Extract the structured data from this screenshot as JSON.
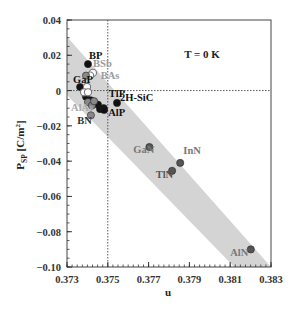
{
  "chart_data": {
    "type": "scatter",
    "title": "",
    "annotation": "T = 0 K",
    "xlabel": "u",
    "ylabel": "P_SP [C/m²]",
    "ylabel_main": "P",
    "ylabel_sub": "SP",
    "ylabel_unit": "[C/m",
    "ylabel_sup": "2",
    "ylabel_close": "]",
    "xlim": [
      0.373,
      0.383
    ],
    "ylim": [
      -0.1,
      0.04
    ],
    "xticks": [
      0.373,
      0.375,
      0.377,
      0.379,
      0.381,
      0.383
    ],
    "xtick_labels": [
      "0.373",
      "0.375",
      "0.377",
      "0.379",
      "0.381",
      "0.383"
    ],
    "yticks": [
      0.04,
      0.02,
      0,
      -0.02,
      -0.04,
      -0.06,
      -0.08,
      -0.1
    ],
    "ytick_labels": [
      "0.04",
      "0.02",
      "0",
      "−0.02",
      "−0.04",
      "−0.06",
      "−0.08",
      "−0.10"
    ],
    "reference_lines": {
      "u_ideal": 0.375,
      "p_zero": 0
    },
    "grid": false,
    "band": {
      "description": "shaded linear trend band",
      "polygon_data": [
        [
          0.373,
          0.0305
        ],
        [
          0.373,
          -0.0025
        ],
        [
          0.3812,
          -0.1
        ],
        [
          0.383,
          -0.1
        ]
      ]
    },
    "series": [
      {
        "name": "black-filled",
        "marker": "filled-circle",
        "color": "#111111",
        "points": [
          {
            "label": "BP",
            "u": 0.37403,
            "p": 0.015
          },
          {
            "label": "GaP",
            "u": 0.37364,
            "p": 0.002
          },
          {
            "label": "",
            "u": 0.37393,
            "p": -0.0035
          },
          {
            "label": "",
            "u": 0.37452,
            "p": -0.008
          },
          {
            "label": "",
            "u": 0.37462,
            "p": -0.0105
          },
          {
            "label": "",
            "u": 0.3748,
            "p": -0.01
          },
          {
            "label": "AlP",
            "u": 0.37482,
            "p": -0.011
          },
          {
            "label": "",
            "u": 0.37417,
            "p": -0.0055
          },
          {
            "label": "TlP 2H-SiC",
            "u": 0.37545,
            "p": -0.007
          }
        ]
      },
      {
        "name": "open-circles",
        "marker": "open-circle",
        "color": "#777777",
        "points": [
          {
            "label": "BSb",
            "u": 0.37427,
            "p": 0.01
          },
          {
            "label": "",
            "u": 0.37413,
            "p": 0.0085
          },
          {
            "label": "BAs",
            "u": 0.37398,
            "p": 0.002
          },
          {
            "label": "",
            "u": 0.37384,
            "p": -0.001
          },
          {
            "label": "",
            "u": 0.37403,
            "p": -0.001
          }
        ]
      },
      {
        "name": "gray-filled",
        "marker": "filled-circle",
        "color": "#888888",
        "points": [
          {
            "label": "",
            "u": 0.37393,
            "p": 0.0085
          },
          {
            "label": "AlAs",
            "u": 0.37403,
            "p": -0.0065
          },
          {
            "label": "",
            "u": 0.37422,
            "p": -0.0085
          },
          {
            "label": "",
            "u": 0.37433,
            "p": -0.006
          },
          {
            "label": "BN",
            "u": 0.37417,
            "p": -0.014
          }
        ]
      },
      {
        "name": "dark-gray-filled",
        "marker": "filled-circle",
        "color": "#555555",
        "points": [
          {
            "label": "GaN",
            "u": 0.37704,
            "p": -0.032
          },
          {
            "label": "InN",
            "u": 0.37855,
            "p": -0.041
          },
          {
            "label": "TlN",
            "u": 0.37815,
            "p": -0.0455
          },
          {
            "label": "AlN",
            "u": 0.38201,
            "p": -0.09
          }
        ]
      }
    ],
    "point_labels": [
      {
        "text": "BP",
        "u": 0.37408,
        "p": 0.018,
        "color": "#111111"
      },
      {
        "text": "BSb",
        "u": 0.37428,
        "p": 0.0135,
        "color": "#9a9a9a"
      },
      {
        "text": "BAs",
        "u": 0.37465,
        "p": 0.0065,
        "color": "#9a9a9a"
      },
      {
        "text": "GaP",
        "u": 0.3733,
        "p": 0.0045,
        "color": "#111111"
      },
      {
        "text": "TlP",
        "u": 0.37505,
        "p": -0.0035,
        "color": "#111111"
      },
      {
        "text": "2H-SiC",
        "u": 0.3756,
        "p": -0.006,
        "color": "#111111"
      },
      {
        "text": "AlAs",
        "u": 0.3732,
        "p": -0.0115,
        "color": "#aaaaaa"
      },
      {
        "text": "AlP",
        "u": 0.37502,
        "p": -0.0145,
        "color": "#111111"
      },
      {
        "text": "BN",
        "u": 0.3735,
        "p": -0.019,
        "color": "#333333"
      },
      {
        "text": "GaN",
        "u": 0.37625,
        "p": -0.0355,
        "color": "#777777"
      },
      {
        "text": "InN",
        "u": 0.3787,
        "p": -0.036,
        "color": "#777777"
      },
      {
        "text": "TlN",
        "u": 0.37735,
        "p": -0.0495,
        "color": "#555555"
      },
      {
        "text": "AlN",
        "u": 0.381,
        "p": -0.0935,
        "color": "#777777"
      }
    ],
    "colors": {
      "band": "#d4d4d4",
      "frame": "#444444",
      "refline": "#444444"
    }
  }
}
